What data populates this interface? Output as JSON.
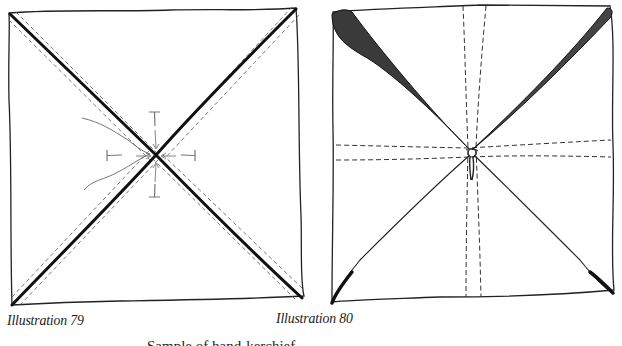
{
  "figures": [
    {
      "id": "illustration-79",
      "caption": "Illustration 79",
      "description": "Square cloth with both diagonals drawn as bold lines flanked by dashed fold lines; four T-shaped pins and arrows point toward the center crossing, with a thread trailing to the left."
    },
    {
      "id": "illustration-80",
      "caption": "Illustration 80",
      "description": "Square cloth gathered and tied at the center; shaded diagonal folds run from the corners to the center knot, with dashed vertical and horizontal seam lines crossing the middle."
    }
  ],
  "subcaption": "Sample of hand-kerchief ..."
}
